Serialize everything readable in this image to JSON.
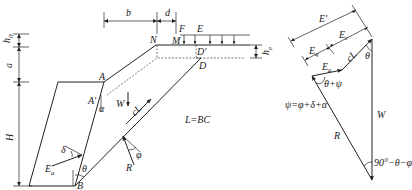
{
  "left_figure": {
    "dimensions": {
      "h0": "h",
      "h0_sub": "0",
      "a": "a",
      "H": "H",
      "b": "b",
      "d": "d",
      "he": "h",
      "he_sub": "e"
    },
    "points": {
      "N": "N",
      "M": "M",
      "F": "F",
      "E": "E",
      "D_prime": "D'",
      "D": "D",
      "A": "A",
      "A_prime": "A'",
      "B": "B"
    },
    "forces": {
      "W": "W",
      "cL": "cL",
      "R": "R",
      "Ea": "E",
      "Ea_sub": "a"
    },
    "angles": {
      "alpha": "α",
      "theta": "θ",
      "delta": "δ",
      "phi": "φ"
    },
    "note": "L=BC"
  },
  "right_figure": {
    "E_prime": "E'",
    "Ea": "E",
    "Ea_sub": "a",
    "Eq": "E",
    "Eq_sub": "q",
    "Ec": "E",
    "Ec_sub": "c",
    "cL": "cL",
    "theta": "θ",
    "theta_plus_psi": "θ+ψ",
    "psi_def": "ψ=φ+δ+α",
    "R": "R",
    "W": "W",
    "bottom_angle": "90°−θ−φ"
  }
}
